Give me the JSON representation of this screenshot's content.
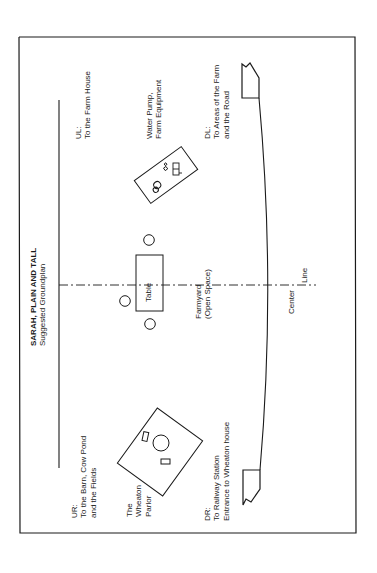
{
  "title": {
    "main": "SARAH, PLAIN AND TALL",
    "subtitle": "Suggested Groundplan"
  },
  "labels": {
    "ul": {
      "line1": "UL:",
      "line2": "To the Farm House"
    },
    "ur": {
      "line1": "UR:",
      "line2": "To the Barn, Cow Pond",
      "line3": "and the Fields"
    },
    "water_pump": {
      "line1": "Water Pump,",
      "line2": "Farm Equipment"
    },
    "parlor": {
      "line1": "The",
      "line2": "Wheaton",
      "line3": "Parlor"
    },
    "table": "Table",
    "farmyard": {
      "line1": "Farmyard",
      "line2": "(Open Space)"
    },
    "center_line": {
      "line1": "Center",
      "line2": "Line"
    },
    "dl": {
      "line1": "DL:",
      "line2": "To Areas of the Farm",
      "line3": "and the Road"
    },
    "dr": {
      "line1": "DR:",
      "line2": "To Railway Station",
      "line3": "Entrance to Wheaton house"
    }
  },
  "colors": {
    "line": "#1a1a1a",
    "background": "#ffffff"
  }
}
